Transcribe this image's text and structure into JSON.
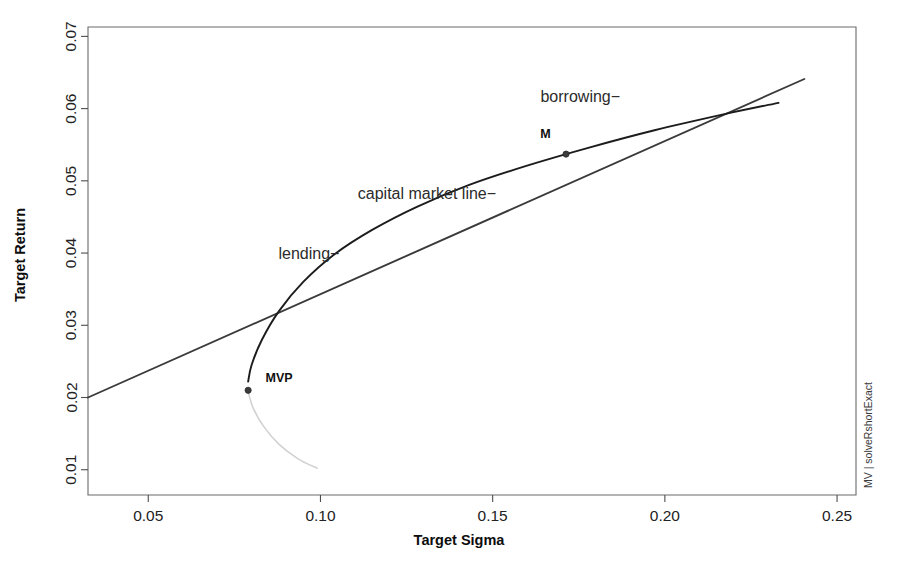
{
  "chart_data": {
    "type": "line",
    "title": "",
    "xlabel": "Target Sigma",
    "ylabel": "Target Return",
    "xlim": [
      0.0325,
      0.2555
    ],
    "ylim": [
      0.0065,
      0.0713
    ],
    "xticks": [
      "0.05",
      "0.10",
      "0.15",
      "0.20",
      "0.25"
    ],
    "xtick_values": [
      0.05,
      0.1,
      0.15,
      0.2,
      0.25
    ],
    "yticks": [
      "0.01",
      "0.02",
      "0.03",
      "0.04",
      "0.05",
      "0.06",
      "0.07"
    ],
    "ytick_values": [
      0.01,
      0.02,
      0.03,
      0.04,
      0.05,
      0.06,
      0.07
    ],
    "grid": false,
    "legend": "none",
    "side_caption": "MV | solveRshortExact",
    "series": [
      {
        "name": "capital market line",
        "style": "straight-line",
        "color": "#3a3a3a",
        "x": [
          0.0325,
          0.05,
          0.075,
          0.1,
          0.125,
          0.15,
          0.1713,
          0.2,
          0.225,
          0.2405
        ],
        "y": [
          0.02,
          0.0237,
          0.029,
          0.0343,
          0.0396,
          0.0449,
          0.0494,
          0.0555,
          0.0608,
          0.0641
        ]
      },
      {
        "name": "efficient frontier",
        "style": "curve",
        "color": "#1c1c1c",
        "x": [
          0.079,
          0.08,
          0.083,
          0.088,
          0.095,
          0.104,
          0.115,
          0.128,
          0.143,
          0.16,
          0.178,
          0.197,
          0.217,
          0.233
        ],
        "y": [
          0.0222,
          0.0245,
          0.028,
          0.032,
          0.036,
          0.0398,
          0.0432,
          0.0464,
          0.0494,
          0.0521,
          0.0546,
          0.057,
          0.0592,
          0.0608
        ]
      },
      {
        "name": "inefficient frontier branch",
        "style": "curve-faded",
        "color": "#d2d2d2",
        "x": [
          0.079,
          0.0805,
          0.0835,
          0.088,
          0.0935,
          0.099
        ],
        "y": [
          0.0208,
          0.0185,
          0.016,
          0.0135,
          0.0115,
          0.0102
        ]
      }
    ],
    "points": [
      {
        "label": "M",
        "x": 0.1713,
        "y": 0.0537,
        "label_dx": -0.006,
        "label_dy": 0.0022
      },
      {
        "label": "MVP",
        "x": 0.079,
        "y": 0.021,
        "label_dx": 0.009,
        "label_dy": 0.0012
      }
    ],
    "annotations": [
      {
        "name": "borrowing",
        "text": "borrowing−",
        "x": 0.187,
        "y": 0.0617,
        "anchor": "end"
      },
      {
        "name": "capital-market-line",
        "text": "capital market line−",
        "x": 0.151,
        "y": 0.0482,
        "anchor": "end"
      },
      {
        "name": "lending",
        "text": "lending−",
        "x": 0.1055,
        "y": 0.04,
        "anchor": "end"
      }
    ]
  }
}
